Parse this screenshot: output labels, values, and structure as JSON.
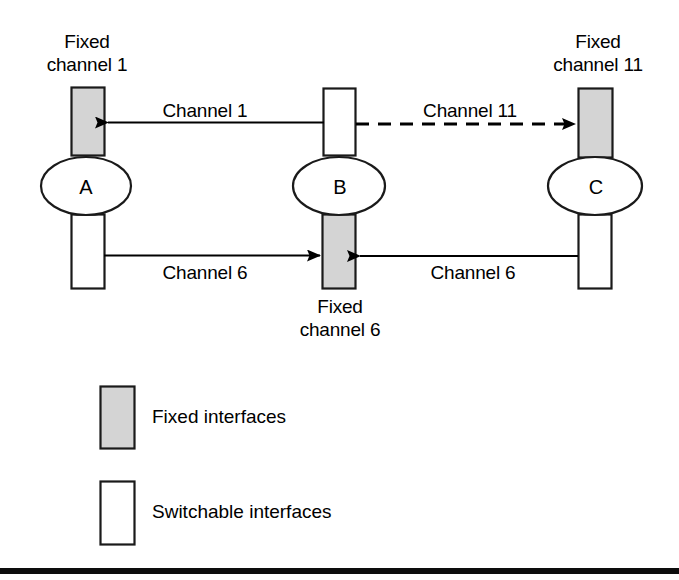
{
  "figure": {
    "type": "network-diagram",
    "background_color": "#ffffff",
    "fixed_interface_fill": "#d4d4d4",
    "switchable_interface_fill": "#ffffff",
    "stroke_color": "#000000",
    "footer_bar_color": "#0d0d0d"
  },
  "nodes": [
    {
      "id": "A",
      "letter": "A",
      "cx": 86,
      "cy": 186
    },
    {
      "id": "B",
      "letter": "B",
      "cx": 339,
      "cy": 186
    },
    {
      "id": "C",
      "letter": "C",
      "cx": 595,
      "cy": 186
    }
  ],
  "interfaces": [
    {
      "id": "a-top",
      "node": "A",
      "position": "top",
      "kind": "fixed",
      "label_line1": "Fixed",
      "label_line2": "channel 1"
    },
    {
      "id": "a-bottom",
      "node": "A",
      "position": "bottom",
      "kind": "switchable",
      "label_line1": "",
      "label_line2": ""
    },
    {
      "id": "b-top",
      "node": "B",
      "position": "top",
      "kind": "switchable",
      "label_line1": "",
      "label_line2": ""
    },
    {
      "id": "b-bottom",
      "node": "B",
      "position": "bottom",
      "kind": "fixed",
      "label_line1": "Fixed",
      "label_line2": "channel 6"
    },
    {
      "id": "c-top",
      "node": "C",
      "position": "top",
      "kind": "fixed",
      "label_line1": "Fixed",
      "label_line2": "channel 11"
    },
    {
      "id": "c-bottom",
      "node": "C",
      "position": "bottom",
      "kind": "switchable",
      "label_line1": "",
      "label_line2": ""
    }
  ],
  "labels": {
    "fixed_channel_1_line1": "Fixed",
    "fixed_channel_1_line2": "channel 1",
    "fixed_channel_11_line1": "Fixed",
    "fixed_channel_11_line2": "channel 11",
    "fixed_channel_6_line1": "Fixed",
    "fixed_channel_6_line2": "channel 6",
    "node_a": "A",
    "node_b": "B",
    "node_c": "C"
  },
  "links": [
    {
      "id": "link-channel-1",
      "label": "Channel 1",
      "from": "B",
      "to": "A",
      "style": "solid",
      "direction": "right-to-left",
      "row": "top"
    },
    {
      "id": "link-channel-11",
      "label": "Channel 11",
      "from": "B",
      "to": "C",
      "style": "dashed",
      "direction": "left-to-right",
      "row": "top"
    },
    {
      "id": "link-channel-6-left",
      "label": "Channel 6",
      "from": "A",
      "to": "B",
      "style": "solid",
      "direction": "left-to-right",
      "row": "bottom"
    },
    {
      "id": "link-channel-6-right",
      "label": "Channel 6",
      "from": "C",
      "to": "B",
      "style": "solid",
      "direction": "right-to-left",
      "row": "bottom"
    }
  ],
  "legend": {
    "items": [
      {
        "id": "legend-fixed",
        "swatch": "fixed",
        "label": "Fixed interfaces"
      },
      {
        "id": "legend-switchable",
        "swatch": "switchable",
        "label": "Switchable interfaces"
      }
    ]
  }
}
